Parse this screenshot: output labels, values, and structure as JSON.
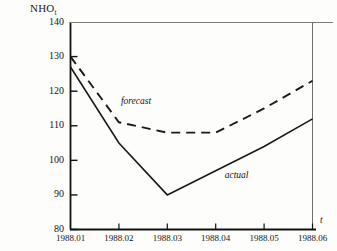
{
  "chart_data": {
    "type": "line",
    "title": "",
    "ylabel": "NHO",
    "ylabel_subscript": "t",
    "xlabel": "t",
    "x": [
      "1988.01",
      "1988.02",
      "1988.03",
      "1988.04",
      "1988.05",
      "1988.06"
    ],
    "xtick_labels": [
      "1988.01",
      "1988.02",
      "1988.03",
      "1988.04",
      "1988.05",
      "1988.06"
    ],
    "ytick_labels": [
      "140",
      "130",
      "120",
      "110",
      "100",
      "90",
      "80"
    ],
    "yticks": [
      140,
      130,
      120,
      110,
      100,
      90,
      80
    ],
    "ylim": [
      80,
      140
    ],
    "grid": false,
    "legend_position": "inline-annotations",
    "series": [
      {
        "name": "forecast",
        "style": "dashed",
        "color": "#1a1a1a",
        "label": "forecast",
        "values": [
          130,
          111,
          108,
          108,
          115,
          123
        ]
      },
      {
        "name": "actual",
        "style": "solid",
        "color": "#1a1a1a",
        "label": "actual",
        "values": [
          127,
          105,
          90,
          97,
          104,
          112
        ]
      }
    ],
    "annotations": [
      {
        "text": "forecast",
        "x": "1988.02",
        "y": 117
      },
      {
        "text": "actual",
        "x": "1988.04",
        "y": 99
      }
    ]
  },
  "axis": {
    "y_top_label": "140",
    "y_bottom_label": "80",
    "x_first_label": "1988.01",
    "x_last_label": "1988.06"
  },
  "colors": {
    "ink": "#1a1a1a",
    "background": "#fdfdfb",
    "axis": "#111111"
  }
}
